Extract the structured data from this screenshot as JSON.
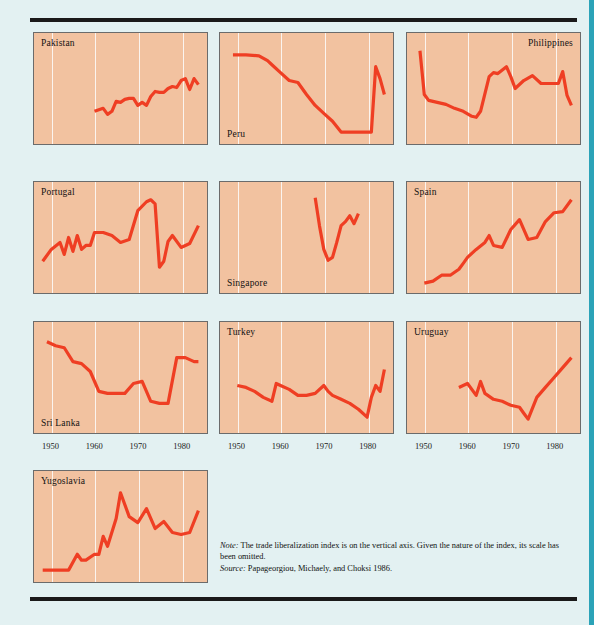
{
  "figure": {
    "axis_ticks": [
      "1950",
      "1960",
      "1970",
      "1980"
    ],
    "note_label": "Note:",
    "note_text": " The trade liberalization index is on the vertical axis. Given the nature of the index, its scale has been omitted.",
    "source_label": "Source:",
    "source_text": " Papageorgiou, Michaely, and Choksi 1986.",
    "colors": {
      "page_background": "#e3f1f2",
      "panel_background": "#f2c2a0",
      "line": "#ef3e23",
      "rule": "#1a1a1a",
      "spine": "#2ba3b8",
      "gridline": "#fdfdfd"
    }
  },
  "chart_data": {
    "type": "line",
    "title": "",
    "xlabel": "",
    "ylabel": "Trade liberalization index",
    "xlim": [
      1946,
      1986
    ],
    "grid": true,
    "legend": "none",
    "note": "Vertical axis scale omitted. Each small multiple plots one country's trade liberalization index over time; values below are normalized 0-100 read off the panel height.",
    "xticks": [
      1950,
      1960,
      1970,
      1980
    ],
    "panels": [
      {
        "name": "Pakistan",
        "label_position": "top-left",
        "x": [
          1960,
          1962,
          1963,
          1964,
          1965,
          1966,
          1967,
          1968,
          1969,
          1970,
          1971,
          1972,
          1973,
          1974,
          1975,
          1976,
          1977,
          1978,
          1979,
          1980,
          1981,
          1982,
          1983,
          1984
        ],
        "values": [
          27,
          30,
          24,
          27,
          37,
          36,
          39,
          40,
          40,
          33,
          36,
          33,
          42,
          47,
          46,
          46,
          50,
          52,
          51,
          58,
          60,
          49,
          60,
          54
        ]
      },
      {
        "name": "Peru",
        "label_position": "bottom-left",
        "x": [
          1949,
          1952,
          1955,
          1957,
          1958,
          1960,
          1962,
          1964,
          1966,
          1968,
          1970,
          1972,
          1974,
          1975,
          1977,
          1979,
          1980,
          1981,
          1982,
          1983,
          1984
        ],
        "values": [
          84,
          84,
          83,
          78,
          74,
          66,
          58,
          56,
          44,
          33,
          25,
          17,
          6,
          6,
          6,
          6,
          6,
          6,
          72,
          60,
          44
        ]
      },
      {
        "name": "Philippines",
        "label_position": "top-right",
        "x": [
          1949,
          1950,
          1951,
          1953,
          1955,
          1957,
          1959,
          1961,
          1962,
          1963,
          1965,
          1966,
          1967,
          1969,
          1970,
          1971,
          1973,
          1975,
          1977,
          1979,
          1981,
          1982,
          1983,
          1984
        ],
        "values": [
          88,
          44,
          38,
          36,
          34,
          30,
          27,
          22,
          21,
          27,
          62,
          66,
          65,
          72,
          62,
          50,
          58,
          63,
          55,
          55,
          55,
          67,
          43,
          33
        ]
      },
      {
        "name": "Portugal",
        "label_position": "top-left",
        "x": [
          1948,
          1950,
          1952,
          1953,
          1954,
          1955,
          1956,
          1957,
          1958,
          1959,
          1960,
          1962,
          1964,
          1966,
          1968,
          1970,
          1972,
          1973,
          1974,
          1975,
          1976,
          1977,
          1978,
          1980,
          1982,
          1984
        ],
        "values": [
          26,
          38,
          45,
          33,
          50,
          36,
          52,
          38,
          42,
          42,
          55,
          55,
          52,
          45,
          48,
          77,
          86,
          88,
          84,
          20,
          26,
          46,
          52,
          40,
          44,
          62
        ]
      },
      {
        "name": "Singapore",
        "label_position": "bottom-left",
        "x": [
          1968,
          1969,
          1970,
          1971,
          1972,
          1973,
          1974,
          1975,
          1976,
          1977,
          1978
        ],
        "values": [
          90,
          62,
          38,
          27,
          30,
          45,
          62,
          66,
          72,
          64,
          74
        ]
      },
      {
        "name": "Spain",
        "label_position": "top-left",
        "x": [
          1950,
          1952,
          1954,
          1956,
          1958,
          1959,
          1960,
          1962,
          1964,
          1965,
          1966,
          1968,
          1970,
          1972,
          1974,
          1976,
          1978,
          1980,
          1982,
          1984
        ],
        "values": [
          4,
          6,
          12,
          12,
          18,
          24,
          30,
          38,
          45,
          52,
          42,
          40,
          58,
          68,
          48,
          50,
          66,
          75,
          76,
          88
        ]
      },
      {
        "name": "Sri Lanka",
        "label_position": "bottom-left",
        "x": [
          1949,
          1951,
          1953,
          1955,
          1957,
          1959,
          1961,
          1963,
          1965,
          1967,
          1969,
          1971,
          1973,
          1975,
          1977,
          1979,
          1981,
          1983,
          1984
        ],
        "values": [
          86,
          82,
          80,
          66,
          64,
          56,
          36,
          34,
          34,
          34,
          44,
          46,
          26,
          24,
          24,
          70,
          70,
          66,
          66
        ]
      },
      {
        "name": "Turkey",
        "label_position": "top-left",
        "x": [
          1950,
          1952,
          1954,
          1956,
          1958,
          1959,
          1960,
          1962,
          1964,
          1966,
          1968,
          1970,
          1971,
          1972,
          1974,
          1976,
          1978,
          1980,
          1981,
          1982,
          1983,
          1984
        ],
        "values": [
          42,
          40,
          36,
          30,
          26,
          44,
          42,
          38,
          32,
          32,
          34,
          42,
          36,
          32,
          28,
          24,
          18,
          10,
          30,
          42,
          36,
          58
        ]
      },
      {
        "name": "Uruguay",
        "label_position": "top-left",
        "x": [
          1958,
          1960,
          1962,
          1963,
          1964,
          1966,
          1968,
          1970,
          1972,
          1973,
          1974,
          1976,
          1978,
          1980,
          1982,
          1984
        ],
        "values": [
          40,
          44,
          32,
          46,
          34,
          28,
          26,
          22,
          20,
          14,
          8,
          30,
          40,
          50,
          60,
          70
        ]
      },
      {
        "name": "Yugoslavia",
        "label_position": "top-left",
        "x": [
          1948,
          1951,
          1954,
          1956,
          1957,
          1958,
          1960,
          1961,
          1962,
          1963,
          1965,
          1966,
          1968,
          1970,
          1972,
          1974,
          1976,
          1978,
          1980,
          1982,
          1984
        ],
        "values": [
          6,
          6,
          6,
          22,
          16,
          16,
          22,
          22,
          40,
          30,
          58,
          84,
          60,
          54,
          68,
          48,
          55,
          44,
          42,
          44,
          66
        ]
      }
    ]
  }
}
